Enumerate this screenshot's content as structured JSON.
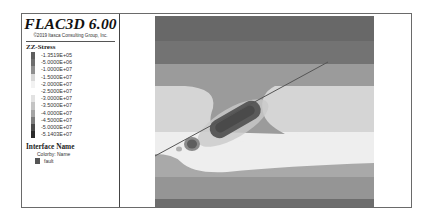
{
  "app": {
    "title": "FLAC3D 6.00",
    "copyright": "©2019 Itasca Consulting Group, Inc."
  },
  "legend": {
    "contour_title": "ZZ-Stress",
    "scale": [
      {
        "label": "-1.3519E+05",
        "color": "#5e5e5e"
      },
      {
        "label": "-5.0000E+06",
        "color": "#6e6e6e"
      },
      {
        "label": "-1.0000E+07",
        "color": "#8f8f8f"
      },
      {
        "label": "-1.5000E+07",
        "color": "#d8d8d8"
      },
      {
        "label": "-2.0000E+07",
        "color": "#f2f2f2"
      },
      {
        "label": "-2.5000E+07",
        "color": "#ffffff"
      },
      {
        "label": "-3.0000E+07",
        "color": "#e2e2e2"
      },
      {
        "label": "-3.5000E+07",
        "color": "#c4c4c4"
      },
      {
        "label": "-4.0000E+07",
        "color": "#a4a4a4"
      },
      {
        "label": "-4.5000E+07",
        "color": "#7c7c7c"
      },
      {
        "label": "-5.0000E+07",
        "color": "#4a4a4a"
      },
      {
        "label": "-5.1403E+07",
        "color": "#2a2a2a"
      }
    ],
    "interface_title": "Interface Name",
    "colorby": "Colorby: Name",
    "interfaces": [
      {
        "label": "fault",
        "color": "#555555"
      }
    ]
  },
  "plot": {
    "bands": [
      {
        "y": 0,
        "h": 25,
        "color": "#686868"
      },
      {
        "y": 25,
        "h": 23,
        "color": "#737373"
      },
      {
        "y": 48,
        "h": 22,
        "color": "#9b9b9b"
      },
      {
        "y": 70,
        "h": 46,
        "color": "#d5d5d5"
      },
      {
        "y": 116,
        "h": 22,
        "color": "#eeeeee"
      },
      {
        "y": 138,
        "h": 23,
        "color": "#a9a9a9"
      },
      {
        "y": 161,
        "h": 22,
        "color": "#959595"
      },
      {
        "y": 183,
        "h": 8,
        "color": "#6d6d6d"
      }
    ]
  }
}
